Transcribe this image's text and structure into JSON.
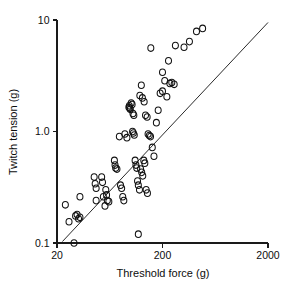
{
  "chart_data": {
    "type": "scatter",
    "title": "",
    "xlabel": "Threshold force (g)",
    "ylabel": "Twitch tension (g)",
    "xscale": "log",
    "yscale": "log",
    "xlim": [
      20,
      2000
    ],
    "ylim": [
      0.1,
      10
    ],
    "xticks": [
      20,
      200,
      2000
    ],
    "xticklabels": [
      "20",
      "200",
      "2000"
    ],
    "yticks": [
      0.1,
      1.0,
      10
    ],
    "yticklabels": [
      "0.1",
      "1.0",
      "10"
    ],
    "grid": false,
    "legend": null,
    "marker": "open-circle",
    "n_points": 85,
    "series": [
      {
        "name": "motor units",
        "points": [
          [
            24,
            0.22
          ],
          [
            33,
            0.26
          ],
          [
            26,
            0.155
          ],
          [
            30,
            0.175
          ],
          [
            31,
            0.18
          ],
          [
            32,
            0.165
          ],
          [
            33,
            0.17
          ],
          [
            29,
            0.1
          ],
          [
            47,
            0.24
          ],
          [
            45,
            0.39
          ],
          [
            46,
            0.34
          ],
          [
            47,
            0.31
          ],
          [
            53,
            0.39
          ],
          [
            54,
            0.35
          ],
          [
            55,
            0.26
          ],
          [
            57,
            0.215
          ],
          [
            58,
            0.3
          ],
          [
            59,
            0.27
          ],
          [
            60,
            0.24
          ],
          [
            62,
            0.235
          ],
          [
            70,
            0.55
          ],
          [
            71,
            0.5
          ],
          [
            72,
            0.47
          ],
          [
            74,
            0.46
          ],
          [
            80,
            0.33
          ],
          [
            82,
            0.31
          ],
          [
            84,
            0.26
          ],
          [
            86,
            0.24
          ],
          [
            78,
            0.9
          ],
          [
            88,
            0.95
          ],
          [
            92,
            0.88
          ],
          [
            96,
            1.65
          ],
          [
            97,
            1.7
          ],
          [
            98,
            1.62
          ],
          [
            99,
            1.58
          ],
          [
            101,
            1.8
          ],
          [
            103,
            1.75
          ],
          [
            105,
            1.45
          ],
          [
            107,
            1.4
          ],
          [
            104,
            1.0
          ],
          [
            106,
            0.97
          ],
          [
            108,
            0.93
          ],
          [
            110,
            0.55
          ],
          [
            112,
            0.5
          ],
          [
            114,
            0.47
          ],
          [
            116,
            0.36
          ],
          [
            118,
            0.33
          ],
          [
            121,
            0.3
          ],
          [
            124,
            0.46
          ],
          [
            127,
            0.43
          ],
          [
            130,
            0.4
          ],
          [
            133,
            0.55
          ],
          [
            136,
            0.52
          ],
          [
            140,
            0.3
          ],
          [
            144,
            0.28
          ],
          [
            118,
            0.12
          ],
          [
            122,
            2.1
          ],
          [
            126,
            2.6
          ],
          [
            129,
            2.0
          ],
          [
            134,
            1.85
          ],
          [
            138,
            1.4
          ],
          [
            143,
            1.35
          ],
          [
            146,
            0.95
          ],
          [
            150,
            0.92
          ],
          [
            154,
            0.9
          ],
          [
            160,
            0.72
          ],
          [
            166,
            0.6
          ],
          [
            175,
            1.2
          ],
          [
            182,
            1.55
          ],
          [
            190,
            2.2
          ],
          [
            200,
            2.3
          ],
          [
            210,
            2.85
          ],
          [
            220,
            2.05
          ],
          [
            235,
            2.7
          ],
          [
            245,
            2.75
          ],
          [
            258,
            2.65
          ],
          [
            200,
            3.4
          ],
          [
            228,
            4.3
          ],
          [
            265,
            5.9
          ],
          [
            320,
            5.7
          ],
          [
            360,
            6.4
          ],
          [
            420,
            7.9
          ],
          [
            480,
            8.4
          ],
          [
            155,
            5.6
          ]
        ]
      }
    ],
    "fit_line": {
      "name": "regression line",
      "x_start": 22.5,
      "y_start": 0.103,
      "x_end": 2000,
      "y_end": 9.5
    }
  }
}
